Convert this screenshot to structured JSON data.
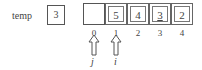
{
  "temp": {
    "label": "temp",
    "value": "3"
  },
  "array": {
    "cells": [
      {
        "index": "0",
        "value": "",
        "style": "single"
      },
      {
        "index": "1",
        "value": "5",
        "style": "double"
      },
      {
        "index": "2",
        "value": "4",
        "style": "double"
      },
      {
        "index": "3",
        "value": "3",
        "style": "double",
        "underlined": true
      },
      {
        "index": "4",
        "value": "2",
        "style": "double"
      }
    ]
  },
  "pointers": [
    {
      "label": "j",
      "at_index": "0"
    },
    {
      "label": "i",
      "at_index": "1"
    }
  ],
  "colors": {
    "stroke": "#555555",
    "text": "#444444",
    "background": "#ffffff"
  }
}
